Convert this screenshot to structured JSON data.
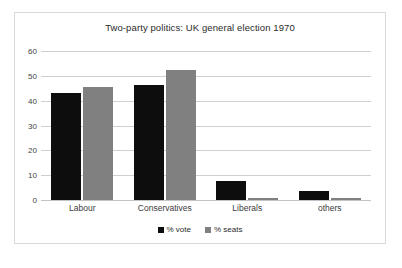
{
  "chart_data": {
    "type": "bar",
    "title": "Two-party politics: UK general election 1970",
    "xlabel": "",
    "ylabel": "",
    "ylim": [
      0,
      60
    ],
    "yticks": [
      0,
      10,
      20,
      30,
      40,
      50,
      60
    ],
    "grid": true,
    "legend_position": "bottom",
    "categories": [
      "Labour",
      "Conservatives",
      "Liberals",
      "others"
    ],
    "series": [
      {
        "name": "% vote",
        "color": "#0d0d0d",
        "values": [
          43.0,
          46.4,
          7.5,
          3.5
        ]
      },
      {
        "name": "% seats",
        "color": "#808080",
        "values": [
          45.5,
          52.4,
          0.9,
          0.8
        ]
      }
    ]
  },
  "legend": {
    "items": [
      {
        "label": "% vote",
        "swatch": "black-square-icon"
      },
      {
        "label": "% seats",
        "swatch": "grey-square-icon"
      }
    ]
  },
  "axis": {
    "y_tick_labels": [
      "60",
      "50",
      "40",
      "30",
      "20",
      "10",
      "0"
    ]
  }
}
